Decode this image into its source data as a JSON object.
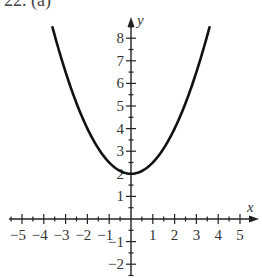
{
  "header": {
    "label": "22. (a)"
  },
  "chart_data": {
    "type": "line",
    "title": "",
    "function": "f(x) = 0.5x^2 + 2",
    "xlabel": "x",
    "ylabel": "y",
    "xlim": [
      -5.8,
      5.8
    ],
    "ylim": [
      -2.5,
      8.8
    ],
    "x_ticks": [
      -5,
      -4,
      -3,
      -2,
      -1,
      1,
      2,
      3,
      4,
      5
    ],
    "y_ticks": [
      -2,
      -1,
      1,
      2,
      3,
      4,
      5,
      6,
      7,
      8
    ],
    "minor_tick_step": 0.5,
    "grid": false,
    "legend": null,
    "series": [
      {
        "name": "parabola",
        "color": "#111111",
        "x": [
          -3.6,
          -3,
          -2.5,
          -2,
          -1.5,
          -1,
          -0.5,
          0,
          0.5,
          1,
          1.5,
          2,
          2.5,
          3,
          3.6
        ],
        "y": [
          8.48,
          6.5,
          5.125,
          4,
          3.125,
          2.5,
          2.125,
          2,
          2.125,
          2.5,
          3.125,
          4,
          5.125,
          6.5,
          8.48
        ]
      }
    ],
    "vertex": [
      0,
      2
    ]
  }
}
